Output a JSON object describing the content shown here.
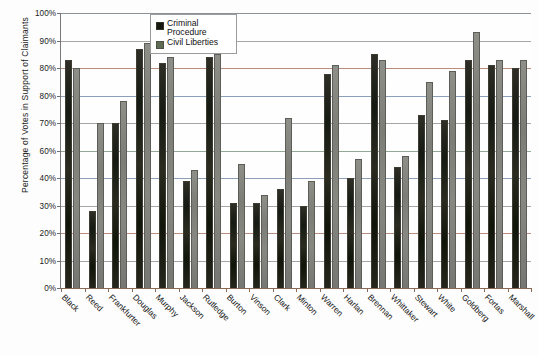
{
  "chart_data": {
    "type": "bar",
    "title": "",
    "xlabel": "",
    "ylabel": "Percentage of Votes in Support of Claimants",
    "ylim": [
      0,
      100
    ],
    "grid": true,
    "legend_position": "top-center",
    "y_tick_labels": [
      "100%",
      "90%",
      "80%",
      "80%",
      "70%",
      "60%",
      "40%",
      "30%",
      "20%",
      "10%",
      "0%"
    ],
    "y_tick_values": [
      100,
      90,
      80,
      80,
      70,
      60,
      40,
      30,
      20,
      10,
      0
    ],
    "categories": [
      "Black",
      "Reed",
      "Frankfurter",
      "Douglas",
      "Murphy",
      "Jackson",
      "Rutledge",
      "Burton",
      "Vinson",
      "Clark",
      "Minton",
      "Warren",
      "Harlan",
      "Brennan",
      "Whittaker",
      "Stewart",
      "White",
      "Goldberg",
      "Fortas",
      "Marshall"
    ],
    "series": [
      {
        "name": "Criminal Procedure",
        "color": "#16180f",
        "values": [
          83,
          28,
          60,
          87,
          82,
          39,
          84,
          31,
          31,
          36,
          30,
          78,
          40,
          85,
          44,
          63,
          61,
          83,
          81,
          80
        ]
      },
      {
        "name": "Civil Liberties",
        "color": "#7d7d78",
        "values": [
          80,
          60,
          68,
          89,
          84,
          43,
          85,
          45,
          34,
          62,
          39,
          81,
          47,
          83,
          48,
          75,
          79,
          93,
          83,
          83
        ]
      }
    ]
  },
  "legend": {
    "items": [
      {
        "label": "Criminal Procedure",
        "swatch": "criminal"
      },
      {
        "label": "Civil Liberties",
        "swatch": "civil"
      }
    ]
  }
}
